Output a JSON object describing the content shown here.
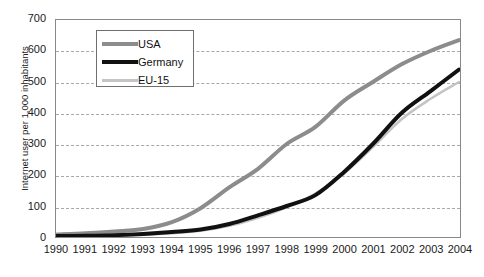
{
  "chart_data": {
    "type": "line",
    "title": "",
    "xlabel": "",
    "ylabel": "Internet user per 1,000 inhabitants",
    "x": [
      1990,
      1991,
      1992,
      1993,
      1994,
      1995,
      1996,
      1997,
      1998,
      1999,
      2000,
      2001,
      2002,
      2003,
      2004
    ],
    "xtick_labels": [
      "1990",
      "1991",
      "1992",
      "1993",
      "1994",
      "1995",
      "1996",
      "1997",
      "1998",
      "1999",
      "2000",
      "2001",
      "2002",
      "2003",
      "2004"
    ],
    "ytick_labels": [
      "0",
      "100",
      "200",
      "300",
      "400",
      "500",
      "600",
      "700"
    ],
    "yticks": [
      0,
      100,
      200,
      300,
      400,
      500,
      600,
      700
    ],
    "ylim": [
      0,
      700
    ],
    "xlim": [
      1990,
      2004
    ],
    "grid": true,
    "legend_position": "upper-left-inside",
    "series": [
      {
        "name": "USA",
        "color": "#8c8c8c",
        "width": 4,
        "values": [
          8,
          12,
          18,
          26,
          48,
          93,
          160,
          220,
          300,
          355,
          440,
          500,
          557,
          600,
          635
        ]
      },
      {
        "name": "Germany",
        "color": "#111111",
        "width": 4,
        "values": [
          3,
          4,
          6,
          10,
          16,
          24,
          42,
          70,
          100,
          135,
          210,
          300,
          400,
          470,
          540
        ]
      },
      {
        "name": "EU-15",
        "color": "#c4c4c4",
        "width": 2.5,
        "values": [
          2,
          3,
          4,
          7,
          12,
          20,
          36,
          62,
          96,
          140,
          205,
          290,
          380,
          445,
          500
        ]
      }
    ]
  },
  "legend": {
    "entries": [
      {
        "label": "USA"
      },
      {
        "label": "Germany"
      },
      {
        "label": "EU-15"
      }
    ]
  }
}
